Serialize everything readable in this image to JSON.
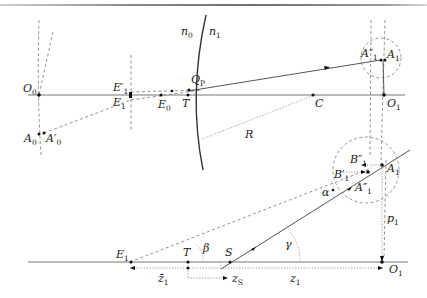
{
  "diagram": {
    "media": {
      "left": "n0",
      "right": "n1"
    },
    "top_panel": {
      "labels": {
        "O0": "O",
        "O0_sub": "0",
        "A0": "A",
        "A0_sub": "0",
        "A0p": "A′",
        "A0p_sub": "0",
        "E1p": "E′",
        "E1p_sub": "1",
        "E1": "E",
        "E1_sub": "1",
        "E0": "E",
        "E0_sub": "0",
        "Qp": "Q",
        "Qp_sub": "P",
        "T": "T",
        "R": "R",
        "C": "C",
        "n0": "n",
        "n0_sub": "0",
        "n1": "n",
        "n1_sub": "1",
        "A1pp": "A″",
        "A1pp_sub": "1",
        "A1": "A",
        "A1_sub": "1",
        "O1": "O",
        "O1_sub": "1"
      }
    },
    "bottom_panel": {
      "labels": {
        "E1": "E",
        "E1_sub": "1",
        "T": "T",
        "S": "S",
        "beta": "β",
        "gamma": "γ",
        "alpha": "α",
        "B1p": "B′",
        "B1p_sub": "1",
        "B1pp": "B″",
        "B1pp_sub": "1",
        "A1pp": "A″",
        "A1pp_sub": "1",
        "A1": "A",
        "A1_sub": "1",
        "p1": "p",
        "p1_sub": "1",
        "O1": "O",
        "O1_sub": "1",
        "zbar1": "z̄",
        "zbar1_sub": "1",
        "zS": "z",
        "zS_sub": "S",
        "z1": "z",
        "z1_sub": "1"
      }
    },
    "colors": {
      "axis": "#777777",
      "ray": "#555555",
      "dashed": "#888888",
      "surface": "#333333",
      "point": "#111111"
    }
  }
}
